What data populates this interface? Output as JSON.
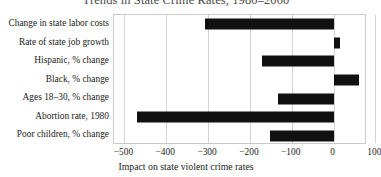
{
  "chart_data": {
    "type": "bar",
    "orientation": "horizontal",
    "title": "Trends in State Crime Rates, 1980–2000",
    "xlabel": "Impact on state violent crime rates",
    "ylabel": "",
    "xlim": [
      -525,
      80
    ],
    "ylim": [
      0,
      7
    ],
    "grid": true,
    "legend": null,
    "bar_color": "#111111",
    "categories": [
      "Change in state labor costs",
      "Rate of state job growth",
      "Hispanic, % change",
      "Black, % change",
      "Ages 18–30, % change",
      "Abortion rate, 1980",
      "Poor children, % change"
    ],
    "values": [
      -307,
      15,
      -172,
      61,
      -134,
      -470,
      -152
    ],
    "xticks": [
      -500,
      -400,
      -300,
      -200,
      -100,
      0,
      100
    ],
    "xticklabels": [
      "−500",
      "−400",
      "−300",
      "−200",
      "−100",
      "0",
      "100"
    ]
  },
  "style": {
    "frame_color": "#c9c9c9",
    "grid_color": "#d3d3d3",
    "title_color": "#4a4a4a",
    "text_color": "#222222",
    "background": "#ffffff"
  }
}
